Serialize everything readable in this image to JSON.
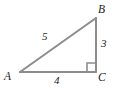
{
  "figure": {
    "name": "right-triangle-abc",
    "background_color": "#ffffff",
    "stroke_color": "#8c8c8c",
    "stroke_width": 2,
    "label_color": "#1c1c1c"
  },
  "vertices": {
    "a": {
      "label": "A",
      "x": 20,
      "y": 72
    },
    "b": {
      "label": "B",
      "x": 96,
      "y": 18
    },
    "c": {
      "label": "C",
      "x": 96,
      "y": 72
    }
  },
  "sides": {
    "hypotenuse": {
      "label": "5",
      "from": "A",
      "to": "B"
    },
    "vertical": {
      "label": "3",
      "from": "B",
      "to": "C"
    },
    "base": {
      "label": "4",
      "from": "A",
      "to": "C"
    }
  },
  "right_angle": {
    "at": "C",
    "marker_size": 9
  },
  "geometry": {
    "polygon_points": "20,72 96,18 96,72",
    "hypotenuse_line": {
      "x1": 20,
      "y1": 72,
      "x2": 96,
      "y2": 18
    },
    "vertical_line": {
      "x1": 96,
      "y1": 18,
      "x2": 96,
      "y2": 72
    },
    "base_line": {
      "x1": 20,
      "y1": 72,
      "x2": 96,
      "y2": 72
    },
    "right_angle_path": "M 87 72 L 87 63 L 96 63"
  }
}
